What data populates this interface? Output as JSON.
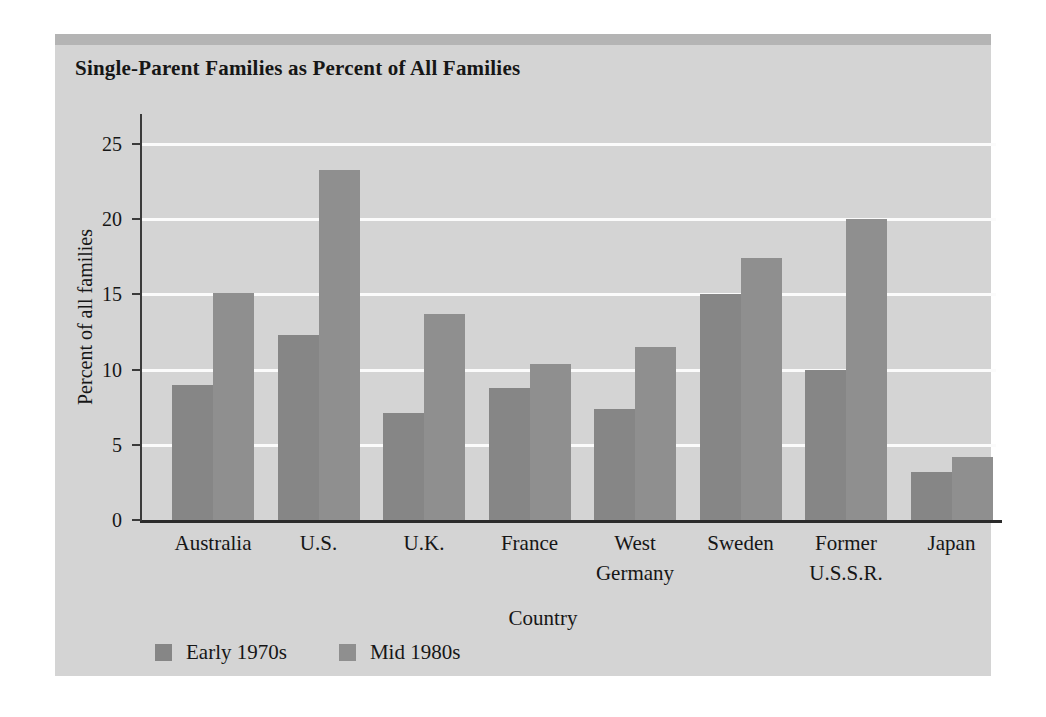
{
  "chart_data": {
    "type": "bar",
    "title": "Single-Parent Families as Percent of All Families",
    "xlabel": "Country",
    "ylabel": "Percent of all families",
    "categories": [
      "Australia",
      "U.S.",
      "U.K.",
      "France",
      "West\nGermany",
      "Sweden",
      "Former\nU.S.S.R.",
      "Japan"
    ],
    "series": [
      {
        "name": "Early 1970s",
        "color": "#868686",
        "values": [
          9.0,
          12.3,
          7.1,
          8.8,
          7.4,
          15.0,
          10.0,
          3.2
        ]
      },
      {
        "name": "Mid 1980s",
        "color": "#8f8f8f",
        "values": [
          15.1,
          23.3,
          13.7,
          10.4,
          11.5,
          17.4,
          20.0,
          4.2
        ]
      }
    ],
    "ylim": [
      0,
      27
    ],
    "yticks": [
      0,
      5,
      10,
      15,
      20,
      25
    ],
    "ytick_labels": [
      "0",
      "5",
      "10",
      "15",
      "20",
      "25"
    ],
    "grid": "horizontal",
    "gridline_color": "#fbfbfb",
    "legend_position": "bottom-left",
    "panel_background": "#d4d4d4",
    "page_background": "#ffffff",
    "axis_color": "#2b2b2b",
    "text_color": "#161616"
  }
}
